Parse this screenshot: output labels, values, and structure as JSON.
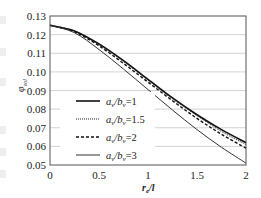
{
  "chart_data": {
    "type": "line",
    "title": "",
    "xlabel": "r_e/l",
    "ylabel": "φ_vol",
    "xlim": [
      0,
      2
    ],
    "ylim": [
      0.05,
      0.13
    ],
    "x_ticks": [
      "0",
      "0.5",
      "1",
      "1.5",
      "2"
    ],
    "y_ticks": [
      "0.05",
      "0.06",
      "0.07",
      "0.08",
      "0.09",
      "0.10",
      "0.11",
      "0.12",
      "0.13"
    ],
    "grid": "horizontal",
    "legend_position": "lower-left (inside plot)",
    "x": [
      0,
      0.25,
      0.5,
      0.75,
      1.0,
      1.25,
      1.5,
      1.75,
      2.0
    ],
    "series": [
      {
        "name": "a_v/b_v=1",
        "style": "solid-thick",
        "values": [
          0.125,
          0.122,
          0.115,
          0.106,
          0.096,
          0.086,
          0.077,
          0.069,
          0.062
        ]
      },
      {
        "name": "a_v/b_v=1.5",
        "style": "dotted",
        "values": [
          0.125,
          0.122,
          0.1145,
          0.1055,
          0.0955,
          0.0855,
          0.0765,
          0.068,
          0.061
        ]
      },
      {
        "name": "a_v/b_v=2",
        "style": "dashed",
        "values": [
          0.125,
          0.1215,
          0.114,
          0.1045,
          0.0945,
          0.0845,
          0.075,
          0.0665,
          0.059
        ]
      },
      {
        "name": "a_v/b_v=3",
        "style": "solid-thin",
        "values": [
          0.125,
          0.121,
          0.112,
          0.1015,
          0.0905,
          0.0795,
          0.069,
          0.0595,
          0.051
        ]
      }
    ]
  },
  "legend": [
    {
      "label_a": "a",
      "sub_a": "v",
      "slash": "/",
      "label_b": "b",
      "sub_b": "v",
      "eq": "=1"
    },
    {
      "label_a": "a",
      "sub_a": "v",
      "slash": "/",
      "label_b": "b",
      "sub_b": "v",
      "eq": "=1.5"
    },
    {
      "label_a": "a",
      "sub_a": "v",
      "slash": "/",
      "label_b": "b",
      "sub_b": "v",
      "eq": "=2"
    },
    {
      "label_a": "a",
      "sub_a": "v",
      "slash": "/",
      "label_b": "b",
      "sub_b": "v",
      "eq": "=3"
    }
  ],
  "axes": {
    "x_label_main": "r",
    "x_label_sub": "e",
    "x_label_tail": "/l",
    "y_label_main": "φ",
    "y_label_sub": "vol"
  }
}
